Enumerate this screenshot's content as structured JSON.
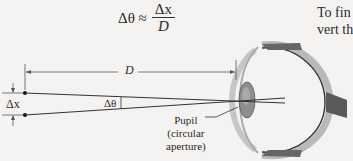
{
  "formula": {
    "lhs": "Δθ ≈",
    "numerator": "Δx",
    "denominator": "D"
  },
  "side_text": {
    "line1": "To fin",
    "line2": "vert th"
  },
  "labels": {
    "distance": "D",
    "separation": "Δx",
    "angle": "Δθ",
    "pupil_line1": "Pupil",
    "pupil_line2": "(circular",
    "pupil_line3": "aperture)"
  }
}
